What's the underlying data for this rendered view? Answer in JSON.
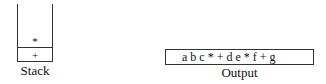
{
  "stack": {
    "label": "Stack",
    "items": [
      "*",
      "+"
    ]
  },
  "output": {
    "label": "Output",
    "value": "a b c * + d e * f + g"
  }
}
